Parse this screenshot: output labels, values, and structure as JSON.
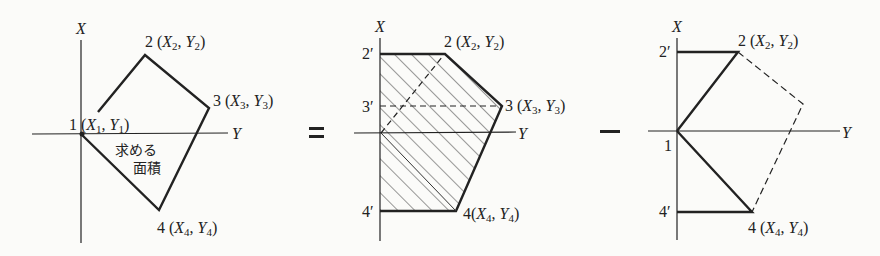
{
  "diagram": {
    "operators": {
      "equals": "=",
      "minus": "−"
    },
    "panels": [
      {
        "id": "left",
        "axis_x_label": "X",
        "axis_y_label": "Y",
        "points": [
          {
            "id": "1",
            "label": "1",
            "coord": "(X1, Y1)"
          },
          {
            "id": "2",
            "label": "2",
            "coord": "(X2, Y2)"
          },
          {
            "id": "3",
            "label": "3",
            "coord": "(X3, Y3)"
          },
          {
            "id": "4",
            "label": "4",
            "coord": "(X4, Y4)"
          }
        ],
        "area_label_line1": "求める",
        "area_label_line2": "面積"
      },
      {
        "id": "middle",
        "axis_x_label": "X",
        "axis_y_label": "Y",
        "projections": [
          "2′",
          "3′",
          "4′"
        ],
        "points": [
          {
            "id": "2",
            "label": "2",
            "coord": "(X2, Y2)"
          },
          {
            "id": "3",
            "label": "3",
            "coord": "(X3, Y3)"
          },
          {
            "id": "4",
            "label": "4",
            "coord": "(X4, Y4)"
          }
        ],
        "shading": "hatched"
      },
      {
        "id": "right",
        "axis_x_label": "X",
        "axis_y_label": "Y",
        "projections": [
          "2′",
          "4′"
        ],
        "points": [
          {
            "id": "1",
            "label": "1"
          },
          {
            "id": "2",
            "label": "2",
            "coord": "(X2, Y2)"
          },
          {
            "id": "4",
            "label": "4",
            "coord": "(X4, Y4)"
          }
        ]
      }
    ]
  }
}
